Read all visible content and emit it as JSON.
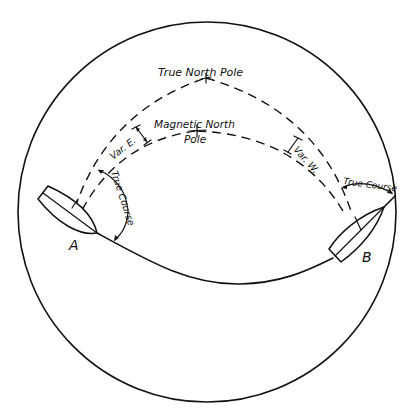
{
  "figure": {
    "type": "great-circle navigation diagram",
    "labels": {
      "true_north_pole": "True North Pole",
      "magnetic_north_pole_line1": "Magnetic North",
      "magnetic_north_pole_line2": "Pole",
      "variation_east": "Var. E.",
      "variation_west": "Var. W.",
      "true_course_a": "True Course",
      "true_course_b": "True Course",
      "point_a": "A",
      "point_b": "B"
    },
    "colors": {
      "ink": "#111111",
      "background": "#ffffff"
    }
  }
}
